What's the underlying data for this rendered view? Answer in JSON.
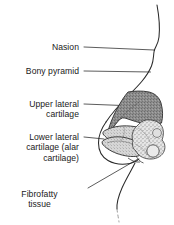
{
  "figure": {
    "type": "anatomical-diagram",
    "orientation": "right-facing lateral profile",
    "background_color": "#ffffff",
    "line_color": "#1a1a1a",
    "labels": [
      {
        "id": "nasion",
        "name": "Nasion",
        "lines": [
          "Nasion"
        ],
        "leader": {
          "from_x": 84,
          "from_y": 47,
          "to_x": 154,
          "to_y": 50
        }
      },
      {
        "id": "bony-pyramid",
        "name": "Bony pyramid",
        "lines": [
          "Bony pyramid"
        ],
        "leader": {
          "from_x": 84,
          "from_y": 71,
          "to_x": 150,
          "to_y": 72
        }
      },
      {
        "id": "upper-lateral-cartilage",
        "name": "Upper lateral cartilage",
        "lines": [
          "Upper lateral",
          "cartilage"
        ],
        "leader": {
          "from_x": 84,
          "from_y": 104,
          "to_x": 135,
          "to_y": 106
        }
      },
      {
        "id": "lower-lateral-cartilage",
        "name": "Lower lateral cartilage (alar cartilage)",
        "lines": [
          "Lower lateral",
          "cartilage (alar",
          "cartilage)"
        ],
        "leader": {
          "from_x": 84,
          "from_y": 137,
          "to_x": 104,
          "to_y": 139
        }
      },
      {
        "id": "fibrofatty-tissue",
        "name": "Fibrofatty tissue",
        "lines": [
          "Fibrofatty",
          "tissue"
        ],
        "leader": {
          "from_x": 88,
          "from_y": 188,
          "to_x": 138,
          "to_y": 160
        }
      }
    ],
    "structures": [
      {
        "id": "upper-lateral-cartilage-shape",
        "name": "Upper lateral cartilage",
        "fill": "#8d8d8d",
        "texture": "fine stipple",
        "description": "Large dark-gray wedge occupying the dorsum of the nose"
      },
      {
        "id": "lower-lateral-cartilage-shape",
        "name": "Lower lateral cartilage (alar cartilage)",
        "fill": "#d2d2d2",
        "texture": "light stipple",
        "description": "Light-gray curved arch forming the nasal tip and ala"
      },
      {
        "id": "fibrofatty-tissue-shape",
        "name": "Fibrofatty tissue",
        "fill": "#e3e3e3",
        "texture": "mottled / coarse stipple",
        "description": "Irregular nodular tissue at the alar base and nostril rim"
      },
      {
        "id": "skin-profile",
        "name": "Skin profile outline",
        "fill": "none",
        "description": "Continuous contour of forehead, nasal dorsum, tip, columella, upper lip and chin"
      }
    ],
    "colors": {
      "ink": "#1a1a1a",
      "upper_lateral_cartilage": "#8d8d8d",
      "lower_lateral_cartilage": "#d2d2d2",
      "fibrofatty_tissue": "#e3e3e3",
      "leader_line": "#4a4a4a",
      "background": "#ffffff"
    }
  }
}
